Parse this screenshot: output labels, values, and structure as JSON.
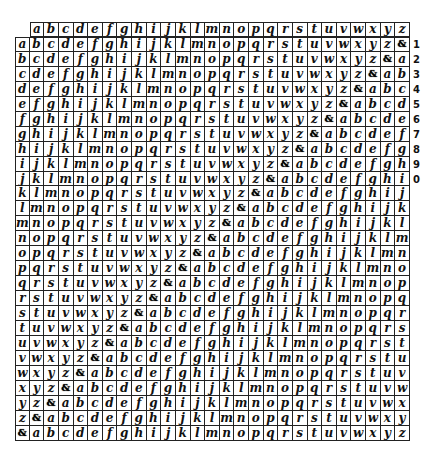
{
  "document": {
    "type": "handwritten cipher table (tabula recta)",
    "alphabet": [
      "a",
      "b",
      "c",
      "d",
      "e",
      "f",
      "g",
      "h",
      "i",
      "j",
      "k",
      "l",
      "m",
      "n",
      "o",
      "p",
      "q",
      "r",
      "s",
      "t",
      "u",
      "v",
      "w",
      "x",
      "y",
      "z",
      "&"
    ],
    "header_row": [
      "a",
      "b",
      "c",
      "d",
      "e",
      "f",
      "g",
      "h",
      "i",
      "j",
      "k",
      "l",
      "m",
      "n",
      "o",
      "p",
      "q",
      "r",
      "s",
      "t",
      "u",
      "v",
      "w",
      "x",
      "y",
      "z"
    ],
    "row_labels": [
      "a",
      "b",
      "c",
      "d",
      "e",
      "f",
      "g",
      "h",
      "i",
      "j",
      "k",
      "l",
      "m",
      "n",
      "o",
      "p",
      "q",
      "r",
      "s",
      "t",
      "u",
      "v",
      "w",
      "x",
      "y",
      "z",
      "&"
    ],
    "right_margin_numbers": [
      "1",
      "2",
      "3",
      "4",
      "5",
      "6",
      "7",
      "8",
      "9",
      "0"
    ],
    "marked_symbol": "&",
    "ink_color": "#111111",
    "paper_color": "#ffffff"
  }
}
